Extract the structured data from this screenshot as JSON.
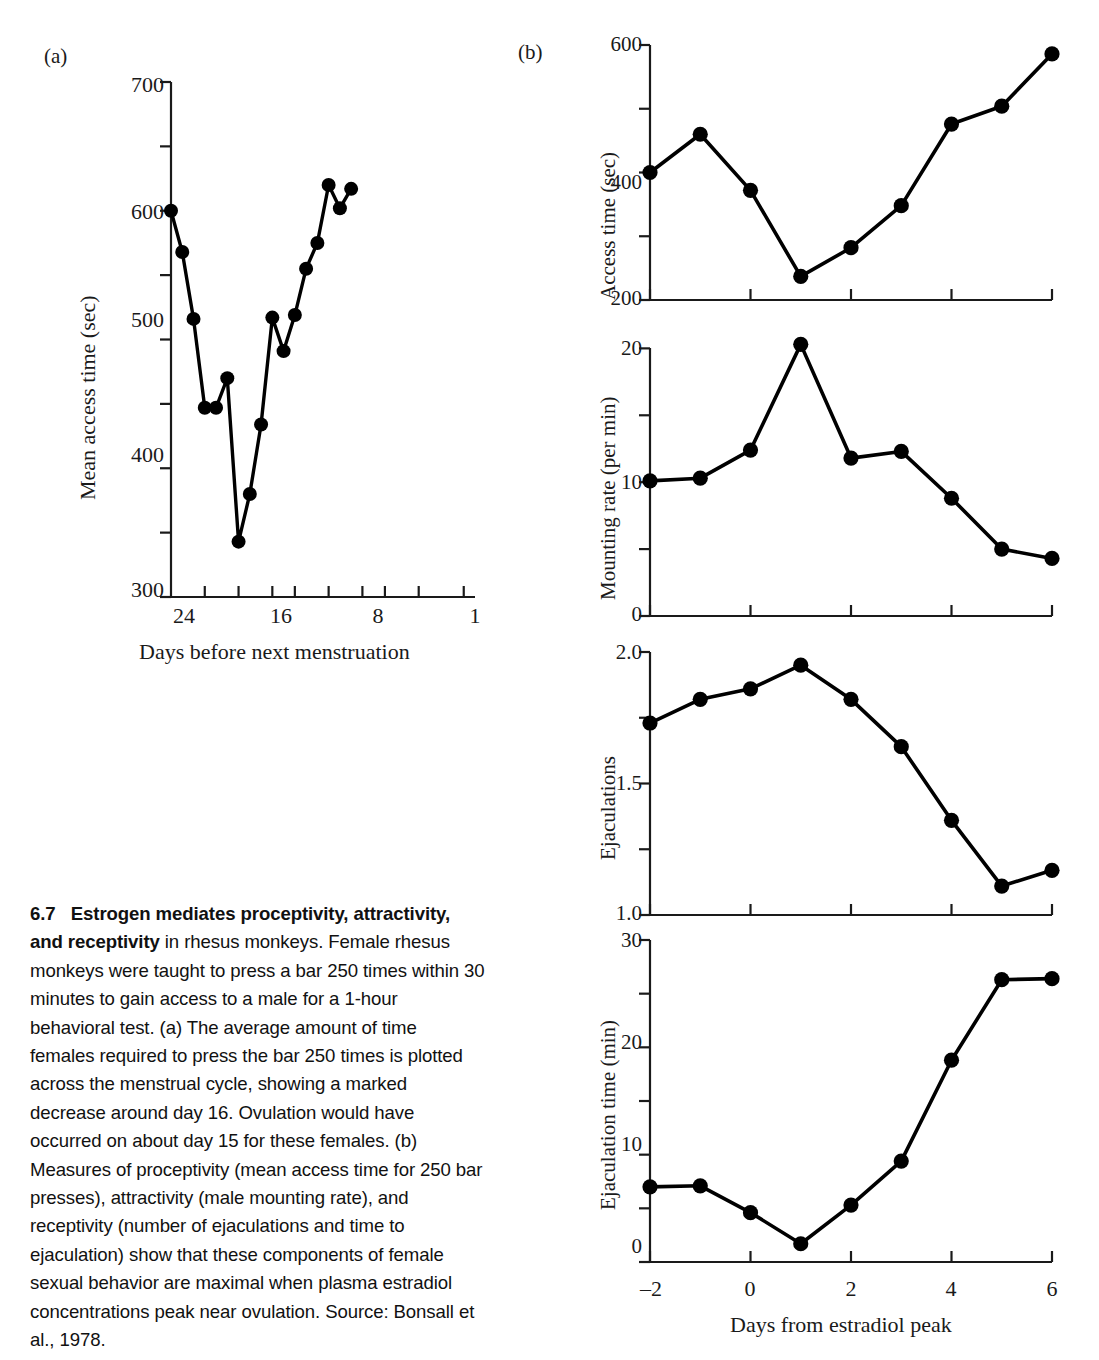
{
  "figure": {
    "panel_a_letter": "(a)",
    "panel_b_letter": "(b)"
  },
  "caption": {
    "number": "6.7",
    "bold_lead": "Estrogen mediates proceptivity, attractivity, and receptivity",
    "rest": " in rhesus monkeys. Female rhesus monkeys were taught to press a bar 250 times within 30 minutes to gain access to a male for a 1-hour behavioral test. (a) The average amount of time females required to press the bar 250 times is plotted across the menstrual cycle, showing a marked decrease around day 16. Ovulation would have occurred on about day 15 for these females. (b) Measures of proceptivity (mean access time for 250 bar presses), attractivity (male mounting rate), and receptivity (number of ejaculations and time to ejaculation) show that these components of female sexual behavior are maximal when plasma estradiol concentrations peak near ovulation. Source: Bonsall et al., 1978."
  },
  "chart_data": [
    {
      "id": "panel-a-mean-access-time",
      "type": "line",
      "title": "",
      "xlabel": "Days before next menstruation",
      "ylabel": "Mean access time (sec)",
      "xlim": [
        27,
        0
      ],
      "ylim": [
        300,
        700
      ],
      "yticks": [
        300,
        400,
        500,
        600,
        700
      ],
      "yticklabels": [
        "300",
        "400",
        "500",
        "600",
        "700"
      ],
      "yminorticks": [
        350,
        450,
        550,
        650
      ],
      "xticks": [
        24,
        21,
        18,
        16,
        13,
        10,
        8,
        5,
        1
      ],
      "xticklabels": [
        "24",
        "",
        "",
        "16",
        "",
        "",
        "8",
        "",
        "1"
      ],
      "grid": false,
      "legend": false,
      "x": [
        27,
        26,
        25,
        24,
        23,
        22,
        21,
        20,
        19,
        18,
        17,
        16,
        15,
        14,
        13,
        12,
        11,
        10,
        9
      ],
      "values": [
        600,
        568,
        516,
        447,
        447,
        470,
        343,
        380,
        434,
        517,
        491,
        519,
        555,
        575,
        620,
        602,
        617
      ]
    },
    {
      "id": "panel-b-access-time",
      "type": "line",
      "title": "",
      "xlabel": "",
      "ylabel": "Access time (sec)",
      "xlim": [
        -2,
        6
      ],
      "ylim": [
        200,
        600
      ],
      "yticks": [
        200,
        400,
        600
      ],
      "yticklabels": [
        "200",
        "400",
        "600"
      ],
      "yminorticks": [
        300,
        500
      ],
      "xticks": [
        -2,
        0,
        2,
        4,
        6
      ],
      "grid": false,
      "legend": false,
      "x": [
        -2,
        -1,
        0,
        1,
        2,
        3,
        4,
        5,
        6
      ],
      "values": [
        400,
        460,
        372,
        237,
        282,
        348,
        476,
        504,
        586
      ]
    },
    {
      "id": "panel-b-mounting-rate",
      "type": "line",
      "title": "",
      "xlabel": "",
      "ylabel": "Mounting rate (per min)",
      "xlim": [
        -2,
        6
      ],
      "ylim": [
        0,
        21
      ],
      "yticks": [
        0,
        10,
        20
      ],
      "yticklabels": [
        "0",
        "10",
        "20"
      ],
      "yminorticks": [
        5,
        15
      ],
      "xticks": [
        -2,
        0,
        2,
        4,
        6
      ],
      "grid": false,
      "legend": false,
      "x": [
        -2,
        -1,
        0,
        1,
        2,
        3,
        4,
        5,
        6
      ],
      "values": [
        10.1,
        10.3,
        12.4,
        20.3,
        11.8,
        12.3,
        8.8,
        5.0,
        4.3
      ]
    },
    {
      "id": "panel-b-ejaculations",
      "type": "line",
      "title": "",
      "xlabel": "",
      "ylabel": "Ejaculations",
      "xlim": [
        -2,
        6
      ],
      "ylim": [
        1.0,
        2.0
      ],
      "yticks": [
        1.0,
        1.5,
        2.0
      ],
      "yticklabels": [
        "1.0",
        "1.5",
        "2.0"
      ],
      "yminorticks": [
        1.25,
        1.75
      ],
      "xticks": [
        -2,
        0,
        2,
        4,
        6
      ],
      "grid": false,
      "legend": false,
      "x": [
        -2,
        -1,
        0,
        1,
        2,
        3,
        4,
        5,
        6
      ],
      "values": [
        1.73,
        1.82,
        1.86,
        1.95,
        1.82,
        1.64,
        1.36,
        1.11,
        1.17
      ]
    },
    {
      "id": "panel-b-ejaculation-time",
      "type": "line",
      "title": "",
      "xlabel": "Days from estradiol peak",
      "ylabel": "Ejaculation time (min)",
      "xlim": [
        -2,
        6
      ],
      "ylim": [
        0,
        30
      ],
      "yticks": [
        0,
        10,
        20,
        30
      ],
      "yticklabels": [
        "0",
        "10",
        "20",
        "30"
      ],
      "yminorticks": [
        5,
        15,
        25
      ],
      "xticks": [
        -2,
        0,
        2,
        4,
        6
      ],
      "xticklabels": [
        "–2",
        "0",
        "2",
        "4",
        "6"
      ],
      "grid": false,
      "legend": false,
      "x": [
        -2,
        -1,
        0,
        1,
        2,
        3,
        4,
        5,
        6
      ],
      "values": [
        7.0,
        7.1,
        4.6,
        1.7,
        5.3,
        9.4,
        18.8,
        26.3,
        26.4
      ]
    }
  ],
  "axis_labels": {
    "panel_a": {
      "ylabel": "Mean access time (sec)",
      "xlabel": "Days before next menstruation",
      "yticks": [
        "700",
        "600",
        "500",
        "400",
        "300"
      ],
      "xticks": [
        "24",
        "16",
        "8",
        "1"
      ]
    },
    "panel_b_access": {
      "ylabel": "Access time (sec)",
      "yticks": [
        "600",
        "400",
        "200"
      ]
    },
    "panel_b_mounting": {
      "ylabel": "Mounting rate (per min)",
      "yticks": [
        "20",
        "10",
        "0"
      ]
    },
    "panel_b_ejac": {
      "ylabel": "Ejaculations",
      "yticks": [
        "2.0",
        "1.5",
        "1.0"
      ]
    },
    "panel_b_ejactime": {
      "ylabel": "Ejaculation time (min)",
      "yticks": [
        "30",
        "20",
        "10",
        "0"
      ],
      "xlabel": "Days from estradiol peak",
      "xticks": [
        "–2",
        "0",
        "2",
        "4",
        "6"
      ]
    }
  },
  "colors": {
    "ink": "#1a1a1a",
    "data": "#000000",
    "background": "#ffffff"
  }
}
